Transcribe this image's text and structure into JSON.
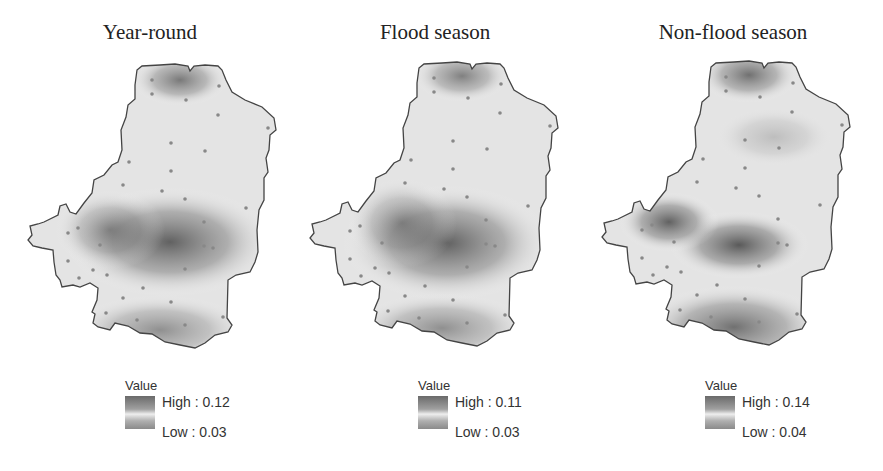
{
  "figure": {
    "panels": [
      {
        "title": "Year-round",
        "legend": {
          "title": "Value",
          "high_label": "High : 0.12",
          "low_label": "Low : 0.03",
          "high": 0.12,
          "low": 0.03
        }
      },
      {
        "title": "Flood season",
        "legend": {
          "title": "Value",
          "high_label": "High : 0.11",
          "low_label": "Low : 0.03",
          "high": 0.11,
          "low": 0.03
        }
      },
      {
        "title": "Non-flood season",
        "legend": {
          "title": "Value",
          "high_label": "High : 0.14",
          "low_label": "Low : 0.04",
          "high": 0.14,
          "low": 0.04
        }
      }
    ],
    "colors": {
      "high": "#555555",
      "low": "#f4f4f4",
      "outline": "#444444",
      "station": "#888888"
    }
  }
}
